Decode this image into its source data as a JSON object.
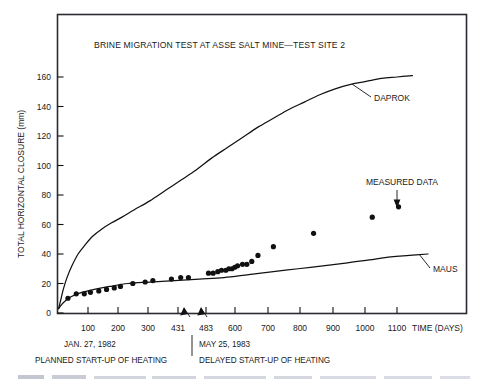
{
  "chart_data": {
    "type": "scatter",
    "title": "BRINE MIGRATION TEST AT ASSE SALT MINE—TEST SITE 2",
    "xlabel": "TIME (DAYS)",
    "ylabel": "TOTAL HORIZONTAL CLOSURE (mm)",
    "xlim": [
      0,
      1240
    ],
    "ylim": [
      0,
      172
    ],
    "grid": false,
    "legend_position": "inline-labels",
    "xticks": [
      {
        "value": 100,
        "label": "100"
      },
      {
        "value": 200,
        "label": "200"
      },
      {
        "value": 300,
        "label": "300"
      },
      {
        "value": 431,
        "label": "431"
      },
      {
        "value": 483,
        "label": "483"
      },
      {
        "value": 600,
        "label": "600"
      },
      {
        "value": 700,
        "label": "700"
      },
      {
        "value": 800,
        "label": "800"
      },
      {
        "value": 900,
        "label": "900"
      },
      {
        "value": 1000,
        "label": "1000"
      },
      {
        "value": 1100,
        "label": "1100"
      }
    ],
    "yticks": [
      {
        "value": 0,
        "label": "0"
      },
      {
        "value": 20,
        "label": "20"
      },
      {
        "value": 40,
        "label": "40"
      },
      {
        "value": 60,
        "label": "60"
      },
      {
        "value": 80,
        "label": "80"
      },
      {
        "value": 100,
        "label": "100"
      },
      {
        "value": 120,
        "label": "120"
      },
      {
        "value": 140,
        "label": "140"
      },
      {
        "value": 160,
        "label": "160"
      }
    ],
    "series": [
      {
        "name": "DAPROK",
        "label": "DAPROK",
        "type": "line",
        "points": [
          [
            5,
            3
          ],
          [
            12,
            9
          ],
          [
            20,
            16
          ],
          [
            32,
            24
          ],
          [
            48,
            32
          ],
          [
            68,
            40
          ],
          [
            90,
            46
          ],
          [
            115,
            52
          ],
          [
            145,
            57
          ],
          [
            175,
            61
          ],
          [
            210,
            65
          ],
          [
            250,
            70
          ],
          [
            300,
            76
          ],
          [
            350,
            83
          ],
          [
            400,
            90
          ],
          [
            450,
            97
          ],
          [
            500,
            105
          ],
          [
            550,
            112
          ],
          [
            600,
            119
          ],
          [
            650,
            126
          ],
          [
            700,
            132
          ],
          [
            750,
            138
          ],
          [
            800,
            143
          ],
          [
            850,
            148
          ],
          [
            900,
            152
          ],
          [
            950,
            155
          ],
          [
            1000,
            157
          ],
          [
            1050,
            159
          ],
          [
            1100,
            160
          ],
          [
            1150,
            161
          ]
        ]
      },
      {
        "name": "MAUS",
        "label": "MAUS",
        "type": "line",
        "points": [
          [
            5,
            3
          ],
          [
            20,
            7
          ],
          [
            45,
            11
          ],
          [
            80,
            14
          ],
          [
            120,
            16
          ],
          [
            170,
            18
          ],
          [
            230,
            20
          ],
          [
            300,
            21
          ],
          [
            380,
            22
          ],
          [
            460,
            23
          ],
          [
            540,
            24
          ],
          [
            620,
            26
          ],
          [
            700,
            28
          ],
          [
            780,
            30
          ],
          [
            860,
            32
          ],
          [
            940,
            34
          ],
          [
            1010,
            36
          ],
          [
            1080,
            38
          ],
          [
            1140,
            39
          ],
          [
            1200,
            40
          ]
        ]
      },
      {
        "name": "MEASURED DATA",
        "label": "MEASURED DATA",
        "type": "scatter",
        "points": [
          [
            35,
            10
          ],
          [
            62,
            13
          ],
          [
            88,
            13
          ],
          [
            108,
            14
          ],
          [
            135,
            15
          ],
          [
            160,
            16
          ],
          [
            185,
            17
          ],
          [
            205,
            18
          ],
          [
            245,
            20
          ],
          [
            285,
            21
          ],
          [
            310,
            22
          ],
          [
            370,
            23
          ],
          [
            400,
            24
          ],
          [
            425,
            24
          ],
          [
            490,
            27
          ],
          [
            505,
            27
          ],
          [
            520,
            28
          ],
          [
            532,
            29
          ],
          [
            546,
            29
          ],
          [
            556,
            30
          ],
          [
            566,
            30
          ],
          [
            575,
            31
          ],
          [
            584,
            32
          ],
          [
            600,
            33
          ],
          [
            614,
            33
          ],
          [
            630,
            35
          ],
          [
            650,
            39
          ],
          [
            700,
            45
          ],
          [
            830,
            54
          ],
          [
            1020,
            65
          ],
          [
            1105,
            72
          ]
        ]
      }
    ],
    "annotations": [
      {
        "id": "planned-startup",
        "date": "JAN. 27, 1982",
        "text": "PLANNED START-UP OF HEATING",
        "x_value": 455
      },
      {
        "id": "delayed-startup",
        "date": "MAY 25, 1983",
        "text": "DELAYED START-UP OF HEATING",
        "x_value": 470
      }
    ]
  },
  "colors": {
    "ink": "#111111",
    "frame": "#2b2b33",
    "background": "#ffffff"
  }
}
